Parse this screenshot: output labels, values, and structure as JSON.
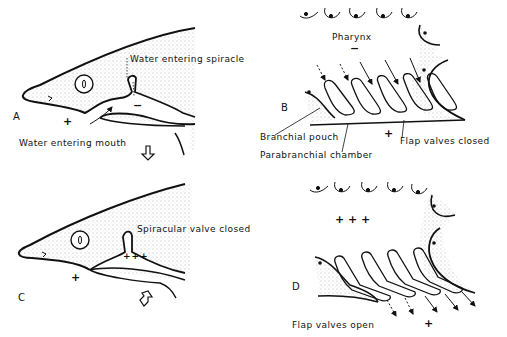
{
  "figure": {
    "panels": {
      "A": {
        "letter": "A",
        "labels": {
          "spiracle": "Water entering spiracle",
          "mouth": "Water entering mouth"
        },
        "signs": {
          "plus": "+",
          "minus": "−"
        },
        "arrow": "down-open-arrow"
      },
      "B": {
        "letter": "B",
        "labels": {
          "pharynx": "Pharynx",
          "branchial_pouch": "Branchial pouch",
          "parabranchial_chamber": "Parabranchial chamber",
          "flap_valves": "Flap valves closed"
        },
        "signs": {
          "minus": "−",
          "plus": "+"
        }
      },
      "C": {
        "letter": "C",
        "labels": {
          "spiracular_valve": "Spiracular valve closed"
        },
        "signs": {
          "plus": "+",
          "plus3": "+++"
        },
        "arrow": "up-open-arrow"
      },
      "D": {
        "letter": "D",
        "labels": {
          "flap_valves": "Flap valves open"
        },
        "signs": {
          "plus3": "+ + +",
          "plus": "+"
        }
      }
    },
    "colors": {
      "ink": "#111111",
      "stipple": "#777777",
      "background": "#ffffff"
    }
  }
}
